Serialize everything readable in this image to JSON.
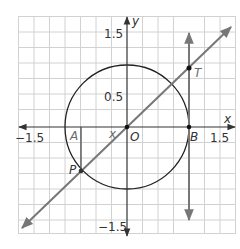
{
  "figure": {
    "type": "unit-circle-tangent-diagram",
    "axes": {
      "x_label": "x",
      "y_label": "y",
      "x_ticks": [
        {
          "value": -1.5,
          "label": "−1.5"
        },
        {
          "value": 1.5,
          "label": "1.5"
        }
      ],
      "y_ticks": [
        {
          "value": 1.5,
          "label": "1.5"
        },
        {
          "value": 0.5,
          "label": "0.5"
        },
        {
          "value": -1.5,
          "label": "−1.5"
        }
      ],
      "grid_step": 0.25,
      "range": [
        -1.75,
        1.75
      ]
    },
    "circle": {
      "center": "O",
      "radius": 1
    },
    "points": {
      "O": {
        "label": "O",
        "desc": "origin"
      },
      "A": {
        "label": "A",
        "desc": "foot of perpendicular from P to x-axis"
      },
      "B": {
        "label": "B",
        "desc": "(1, 0)"
      },
      "P": {
        "label": "P",
        "desc": "point on circle in quadrant III"
      },
      "T": {
        "label": "T",
        "desc": "intersection of line OP with tangent at B"
      }
    },
    "angle_label": "x",
    "colors": {
      "grid": "#d0d0d0",
      "axes": "#333333",
      "circle": "#222222",
      "line": "#777777",
      "point": "#111111"
    }
  }
}
